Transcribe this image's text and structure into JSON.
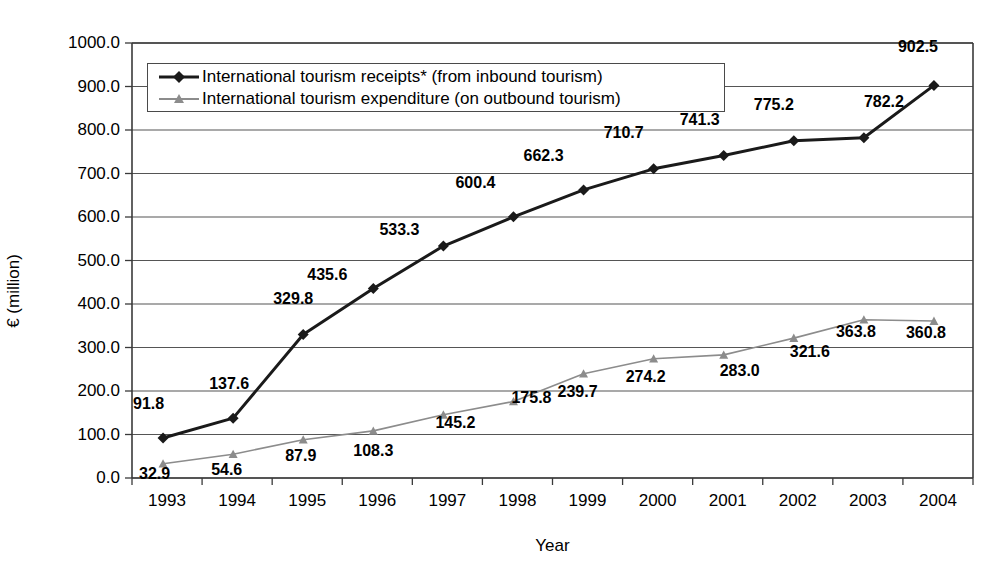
{
  "chart_data": {
    "type": "line",
    "title": "",
    "xlabel": "Year",
    "ylabel": "€ (million)",
    "categories": [
      "1993",
      "1994",
      "1995",
      "1996",
      "1997",
      "1998",
      "1999",
      "2000",
      "2001",
      "2002",
      "2003",
      "2004"
    ],
    "ylim": [
      0,
      1000
    ],
    "ytick_step": 100,
    "yticks": [
      "0.0",
      "100.0",
      "200.0",
      "300.0",
      "400.0",
      "500.0",
      "600.0",
      "700.0",
      "800.0",
      "900.0",
      "1000.0"
    ],
    "grid": "horizontal",
    "legend_position": "top-left-inside",
    "series": [
      {
        "name": "International tourism receipts* (from inbound tourism)",
        "color": "#1a1a1a",
        "marker": "diamond",
        "line_width": 3,
        "values": [
          91.8,
          137.6,
          329.8,
          435.6,
          533.3,
          600.4,
          662.3,
          710.7,
          741.3,
          775.2,
          782.2,
          902.5
        ],
        "labels": [
          "91.8",
          "137.6",
          "329.8",
          "435.6",
          "533.3",
          "600.4",
          "662.3",
          "710.7",
          "741.3",
          "775.2",
          "782.2",
          "902.5"
        ]
      },
      {
        "name": "International tourism expenditure (on outbound tourism)",
        "color": "#8c8c8c",
        "marker": "triangle",
        "line_width": 1.6,
        "values": [
          32.9,
          54.6,
          87.9,
          108.3,
          145.2,
          175.8,
          239.7,
          274.2,
          283.0,
          321.6,
          363.8,
          360.8
        ],
        "labels": [
          "32.9",
          "54.6",
          "87.9",
          "108.3",
          "145.2",
          "175.8",
          "239.7",
          "274.2",
          "283.0",
          "321.6",
          "363.8",
          "360.8"
        ]
      }
    ]
  },
  "axes": {
    "x_title": "Year",
    "y_title": "€ (million)"
  },
  "legend": {
    "entries": [
      "International tourism receipts* (from inbound tourism)",
      "International tourism expenditure (on outbound tourism)"
    ]
  },
  "colors": {
    "series_receipts": "#1a1a1a",
    "series_expenditure": "#8c8c8c",
    "gridline": "#555555",
    "axis": "#3a3a3a",
    "background": "#ffffff"
  }
}
